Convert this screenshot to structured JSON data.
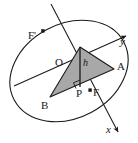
{
  "figure": {
    "colors": {
      "stroke": "#1a1a1a",
      "fill_triangle": "#a8a8a8",
      "background": "#ffffff"
    }
  },
  "labels": {
    "focus_left": "F'",
    "focus_right": "F",
    "center": "O",
    "vertex_a": "A",
    "vertex_b": "B",
    "foot_point": "P",
    "height": "h",
    "axis_x": "x",
    "axis_y": "y"
  },
  "geometry": {
    "ellipse": {
      "center_x": 69,
      "center_y": 71,
      "radius_x": 62,
      "radius_y": 47,
      "rotation_deg": -28
    },
    "triangle": {
      "apex": [
        80,
        47
      ],
      "vertex_a": [
        114,
        69
      ],
      "vertex_b": [
        50,
        97
      ]
    },
    "height_segment": {
      "from": [
        80,
        47
      ],
      "to": [
        80,
        86
      ]
    },
    "foci": {
      "left": [
        43,
        31
      ],
      "right": [
        90,
        90
      ]
    },
    "axes": {
      "y_axis": {
        "from": [
          20,
          83
        ],
        "to": [
          128,
          35
        ],
        "label_at": [
          122,
          41
        ]
      },
      "x_axis": {
        "from": [
          52,
          5
        ],
        "to": [
          120,
          134
        ],
        "label_at": [
          109,
          128
        ]
      }
    },
    "center_point": [
      62,
      63
    ]
  }
}
